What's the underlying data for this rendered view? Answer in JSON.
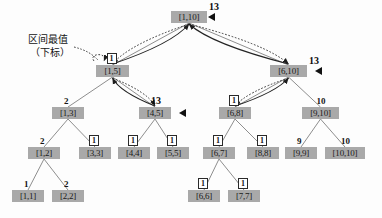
{
  "figure": {
    "type": "segment-tree-diagram",
    "width": 382,
    "height": 218,
    "background": "#fdfdfd",
    "node_fill": "#a9a9a9",
    "node_text_color": "#1a1a1a",
    "edge_color": "#8a8a8a",
    "pointer_color": "#222222"
  },
  "annotation": {
    "line1": "区间最值",
    "line2": "（下标）"
  },
  "nodes": [
    {
      "id": "n1_10",
      "label": "[1,10]",
      "x": 171,
      "y": 11,
      "w": 36,
      "value": "13",
      "value_style": "plain",
      "marker": true
    },
    {
      "id": "n1_5",
      "label": "[1,5]",
      "x": 96,
      "y": 65,
      "w": 33,
      "value": "1",
      "value_style": "box",
      "marker": false
    },
    {
      "id": "n6_10",
      "label": "[6,10]",
      "x": 270,
      "y": 65,
      "w": 37,
      "value": "13",
      "value_style": "plain",
      "marker": true
    },
    {
      "id": "n1_3",
      "label": "[1,3]",
      "x": 52,
      "y": 107,
      "w": 32,
      "value": "2",
      "value_style": "plain",
      "marker": false
    },
    {
      "id": "n4_5",
      "label": "[4,5]",
      "x": 139,
      "y": 107,
      "w": 32,
      "value": "13",
      "value_style": "plain",
      "marker": true
    },
    {
      "id": "n6_8",
      "label": "[6,8]",
      "x": 219,
      "y": 107,
      "w": 32,
      "value": "1",
      "value_style": "box",
      "marker": false
    },
    {
      "id": "n9_10",
      "label": "[9,10]",
      "x": 302,
      "y": 107,
      "w": 37,
      "value": "10",
      "value_style": "plain",
      "marker": false
    },
    {
      "id": "n1_2",
      "label": "[1,2]",
      "x": 28,
      "y": 147,
      "w": 32,
      "value": "2",
      "value_style": "plain",
      "marker": false
    },
    {
      "id": "n3_3",
      "label": "[3,3]",
      "x": 79,
      "y": 147,
      "w": 32,
      "value": "1",
      "value_style": "box",
      "marker": false
    },
    {
      "id": "n4_4",
      "label": "[4,4]",
      "x": 118,
      "y": 147,
      "w": 32,
      "value": "1",
      "value_style": "box",
      "marker": false
    },
    {
      "id": "n5_5",
      "label": "[5,5]",
      "x": 157,
      "y": 147,
      "w": 32,
      "value": "1",
      "value_style": "box",
      "marker": false
    },
    {
      "id": "n6_7",
      "label": "[6,7]",
      "x": 203,
      "y": 147,
      "w": 32,
      "value": "1",
      "value_style": "box",
      "marker": false
    },
    {
      "id": "n8_8",
      "label": "[8,8]",
      "x": 247,
      "y": 147,
      "w": 32,
      "value": "1",
      "value_style": "box",
      "marker": false
    },
    {
      "id": "n9_9",
      "label": "[9,9]",
      "x": 285,
      "y": 147,
      "w": 32,
      "value": "9",
      "value_style": "plain",
      "marker": false
    },
    {
      "id": "n10_10",
      "label": "[10,10]",
      "x": 325,
      "y": 147,
      "w": 40,
      "value": "10",
      "value_style": "plain",
      "marker": false
    },
    {
      "id": "n1_1",
      "label": "[1,1]",
      "x": 12,
      "y": 190,
      "w": 32,
      "value": "1",
      "value_style": "plain",
      "marker": false
    },
    {
      "id": "n2_2",
      "label": "[2,2]",
      "x": 52,
      "y": 190,
      "w": 32,
      "value": "2",
      "value_style": "plain",
      "marker": false
    },
    {
      "id": "n6_6",
      "label": "[6,6]",
      "x": 188,
      "y": 190,
      "w": 32,
      "value": "1",
      "value_style": "box",
      "marker": false
    },
    {
      "id": "n7_7",
      "label": "[7,7]",
      "x": 228,
      "y": 190,
      "w": 32,
      "value": "1",
      "value_style": "box",
      "marker": false
    }
  ],
  "tree_edges": [
    {
      "from": "n1_10",
      "to": "n1_5"
    },
    {
      "from": "n1_10",
      "to": "n6_10"
    },
    {
      "from": "n1_5",
      "to": "n1_3"
    },
    {
      "from": "n1_5",
      "to": "n4_5"
    },
    {
      "from": "n6_10",
      "to": "n6_8"
    },
    {
      "from": "n6_10",
      "to": "n9_10"
    },
    {
      "from": "n1_3",
      "to": "n1_2"
    },
    {
      "from": "n1_3",
      "to": "n3_3"
    },
    {
      "from": "n4_5",
      "to": "n4_4"
    },
    {
      "from": "n4_5",
      "to": "n5_5"
    },
    {
      "from": "n6_8",
      "to": "n6_7"
    },
    {
      "from": "n6_8",
      "to": "n8_8"
    },
    {
      "from": "n9_10",
      "to": "n9_9"
    },
    {
      "from": "n9_10",
      "to": "n10_10"
    },
    {
      "from": "n1_2",
      "to": "n1_1"
    },
    {
      "from": "n1_2",
      "to": "n2_2"
    },
    {
      "from": "n6_7",
      "to": "n6_6"
    },
    {
      "from": "n6_7",
      "to": "n7_7"
    }
  ],
  "pointer_arrows": [
    {
      "name": "root-to-left-child-query",
      "from": "n1_10",
      "to": "n1_5",
      "style": "dotted"
    },
    {
      "name": "left-child-to-root-return",
      "from": "n1_5",
      "to": "n1_10",
      "style": "solid"
    },
    {
      "name": "root-to-right-child-query",
      "from": "n1_10",
      "to": "n6_10",
      "style": "dotted"
    },
    {
      "name": "right-child-to-root-return",
      "from": "n6_10",
      "to": "n1_10",
      "style": "solid"
    },
    {
      "name": "left-to-grandchild-query",
      "from": "n1_5",
      "to": "n4_5",
      "style": "dotted"
    },
    {
      "name": "grandchild-to-left-return",
      "from": "n4_5",
      "to": "n1_5",
      "style": "solid"
    },
    {
      "name": "right-to-grandchild-query",
      "from": "n6_10",
      "to": "n6_8",
      "style": "dotted"
    },
    {
      "name": "grandchild-to-right-return",
      "from": "n6_8",
      "to": "n6_10",
      "style": "solid"
    },
    {
      "name": "self-loop-left-subtree",
      "from": "n1_5",
      "to": "n1_5",
      "style": "dotted"
    }
  ],
  "annotation_pointer": {
    "name": "annotation-leader-line",
    "style": "dotted"
  }
}
